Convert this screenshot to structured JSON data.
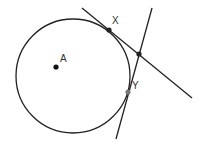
{
  "diagram": {
    "circle": {
      "cx": 73,
      "cy": 76,
      "r": 57,
      "stroke": "#222222"
    },
    "lines": [
      {
        "name": "tangent-at-x",
        "x1": 82,
        "y1": 8,
        "x2": 192,
        "y2": 98
      },
      {
        "name": "tangent-at-y",
        "x1": 152,
        "y1": 8,
        "x2": 116,
        "y2": 139
      }
    ],
    "points": [
      {
        "name": "A",
        "label": "A",
        "x": 56,
        "y": 67,
        "lx": 60,
        "ly": 62,
        "fill": "#111111"
      },
      {
        "name": "X",
        "label": "X",
        "x": 109,
        "y": 30,
        "lx": 112,
        "ly": 24,
        "fill": "#222222"
      },
      {
        "name": "P",
        "label": "",
        "x": 139,
        "y": 54,
        "lx": 0,
        "ly": 0,
        "fill": "#222222"
      },
      {
        "name": "Y",
        "label": "Y",
        "x": 128,
        "y": 92,
        "lx": 132,
        "ly": 89,
        "fill": "#777777"
      }
    ]
  }
}
